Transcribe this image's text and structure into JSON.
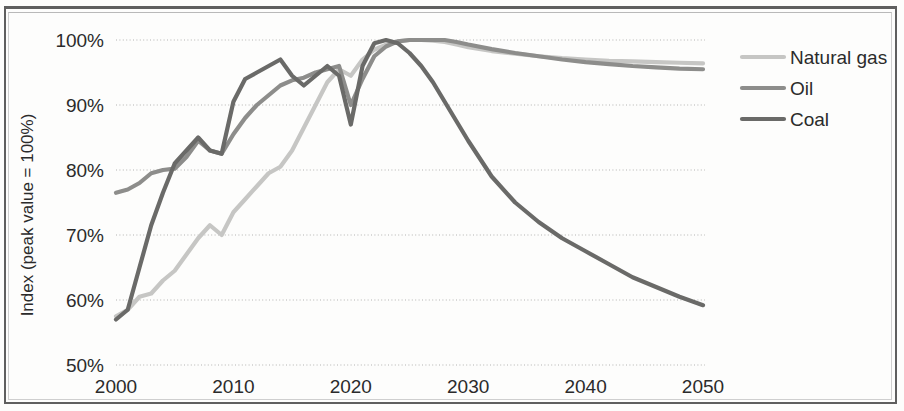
{
  "chart_data": {
    "type": "line",
    "title": "",
    "xlabel": "",
    "ylabel": "Index (peak value = 100%)",
    "xlim": [
      2000,
      2050
    ],
    "ylim": [
      50,
      100
    ],
    "xticks": [
      "2000",
      "2010",
      "2020",
      "2030",
      "2040",
      "2050"
    ],
    "yticks": [
      "50%",
      "60%",
      "70%",
      "80%",
      "90%",
      "100%"
    ],
    "grid": "horizontal-dotted",
    "legend_position": "right",
    "x": [
      2000,
      2001,
      2002,
      2003,
      2004,
      2005,
      2006,
      2007,
      2008,
      2009,
      2010,
      2011,
      2012,
      2013,
      2014,
      2015,
      2016,
      2017,
      2018,
      2019,
      2020,
      2021,
      2022,
      2023,
      2024,
      2025,
      2026,
      2027,
      2028,
      2029,
      2030,
      2032,
      2034,
      2036,
      2038,
      2040,
      2042,
      2044,
      2046,
      2048,
      2050
    ],
    "series": [
      {
        "name": "Natural gas",
        "color": "#c6c6c4",
        "values": [
          57.5,
          58.5,
          60.5,
          61.0,
          63.0,
          64.5,
          67.0,
          69.5,
          71.5,
          70.0,
          73.5,
          75.5,
          77.5,
          79.5,
          80.5,
          83.0,
          86.5,
          90.0,
          93.5,
          95.5,
          94.5,
          97.0,
          98.5,
          99.3,
          99.8,
          100.0,
          100.0,
          99.9,
          99.7,
          99.3,
          98.9,
          98.3,
          97.9,
          97.5,
          97.2,
          97.0,
          96.8,
          96.7,
          96.6,
          96.5,
          96.4
        ]
      },
      {
        "name": "Oil",
        "color": "#8d8d8b",
        "values": [
          76.5,
          77.0,
          78.0,
          79.5,
          80.0,
          80.2,
          82.0,
          84.5,
          83.0,
          82.5,
          85.5,
          88.0,
          90.0,
          91.5,
          93.0,
          93.8,
          94.2,
          95.0,
          95.5,
          96.0,
          90.0,
          94.0,
          97.5,
          99.0,
          99.8,
          100.0,
          100.0,
          100.0,
          100.0,
          99.7,
          99.3,
          98.6,
          98.0,
          97.5,
          97.0,
          96.6,
          96.3,
          96.0,
          95.8,
          95.6,
          95.5
        ]
      },
      {
        "name": "Coal",
        "color": "#6a6a68",
        "values": [
          57.0,
          58.5,
          65.0,
          71.5,
          76.5,
          81.0,
          83.0,
          85.0,
          83.0,
          82.5,
          90.5,
          94.0,
          95.0,
          96.0,
          97.0,
          94.5,
          93.0,
          94.5,
          96.0,
          94.5,
          87.0,
          96.0,
          99.5,
          100.0,
          99.5,
          98.0,
          96.0,
          93.5,
          90.5,
          87.5,
          84.5,
          79.0,
          75.0,
          72.0,
          69.5,
          67.5,
          65.5,
          63.5,
          62.0,
          60.5,
          59.2
        ]
      }
    ]
  },
  "legend": {
    "items": [
      {
        "label": "Natural gas",
        "color": "#c6c6c4"
      },
      {
        "label": "Oil",
        "color": "#8d8d8b"
      },
      {
        "label": "Coal",
        "color": "#6a6a68"
      }
    ]
  },
  "axes": {
    "y_title": "Index (peak value = 100%)",
    "y_ticks": [
      "100%",
      "90%",
      "80%",
      "70%",
      "60%",
      "50%"
    ],
    "x_ticks": [
      "2000",
      "2010",
      "2020",
      "2030",
      "2040",
      "2050"
    ]
  }
}
